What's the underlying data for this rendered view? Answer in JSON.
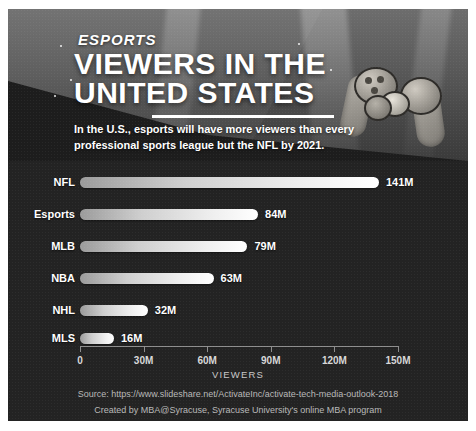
{
  "header": {
    "eyebrow": "ESPORTS",
    "title_line1": "VIEWERS IN THE",
    "title_line2": "UNITED STATES"
  },
  "subtitle": {
    "line1": "In the U.S., esports will have more viewers than every",
    "line2": "professional sports league but the NFL by 2021."
  },
  "footer": {
    "source": "Source: https://www.slideshare.net/ActivateInc/activate-tech-media-outlook-2018",
    "credit": "Created by MBA@Syracuse, Syracuse University's online MBA program"
  },
  "chart_data": {
    "type": "bar",
    "orientation": "horizontal",
    "title": "VIEWERS IN THE UNITED STATES",
    "xlabel": "VIEWERS",
    "ylabel": "",
    "xlim": [
      0,
      150
    ],
    "grid": false,
    "legend": null,
    "tick_labels": [
      "0",
      "30M",
      "60M",
      "90M",
      "120M",
      "150M"
    ],
    "tick_values": [
      0,
      30,
      60,
      90,
      120,
      150
    ],
    "categories": [
      "NFL",
      "Esports",
      "MLB",
      "NBA",
      "NHL",
      "MLS"
    ],
    "values": [
      141,
      84,
      79,
      63,
      32,
      16
    ],
    "value_labels": [
      "141M",
      "84M",
      "79M",
      "63M",
      "32M",
      "16M"
    ],
    "units": "millions of viewers"
  },
  "colors": {
    "background": "#232323",
    "bar_light": "#ffffff",
    "bar_dark": "#9b9b9b",
    "text": "#ffffff",
    "axis": "#8d8d8d",
    "footer_text": "#b9b9b9"
  }
}
